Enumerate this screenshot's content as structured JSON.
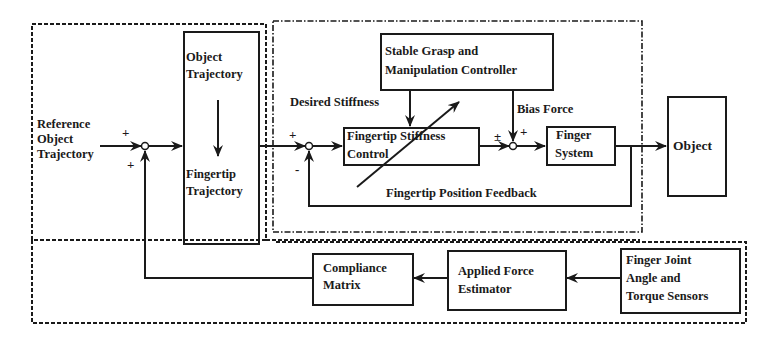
{
  "diagram": {
    "type": "block-diagram",
    "blocks": {
      "object_trajectory": "Object Trajectory",
      "object_trajectory_l1": "Object",
      "object_trajectory_l2": "Trajectory",
      "fingertip_trajectory_l1": "Fingertip",
      "fingertip_trajectory_l2": "Trajectory",
      "stable_grasp_l1": "Stable Grasp and",
      "stable_grasp_l2": "Manipulation Controller",
      "stiffness_control_l1": "Fingertip Stiffness",
      "stiffness_control_l2": "Control",
      "finger_system_l1": "Finger",
      "finger_system_l2": "System",
      "object": "Object",
      "compliance_l1": "Compliance",
      "compliance_l2": "Matrix",
      "force_estimator_l1": "Applied Force",
      "force_estimator_l2": "Estimator",
      "sensors_l1": "Finger Joint",
      "sensors_l2": "Angle and",
      "sensors_l3": "Torque Sensors"
    },
    "labels": {
      "reference_l1": "Reference",
      "reference_l2": "Object",
      "reference_l3": "Trajectory",
      "desired_stiffness": "Desired Stiffness",
      "bias_force": "Bias Force",
      "position_feedback": "Fingertip Position Feedback"
    },
    "signs": {
      "j1_top": "+",
      "j1_bottom": "+",
      "j2_top": "+",
      "j2_bottom": "-",
      "j3_left": "±",
      "j3_right": "+"
    },
    "colors": {
      "line": "#1a1a1a",
      "background": "#ffffff"
    }
  }
}
